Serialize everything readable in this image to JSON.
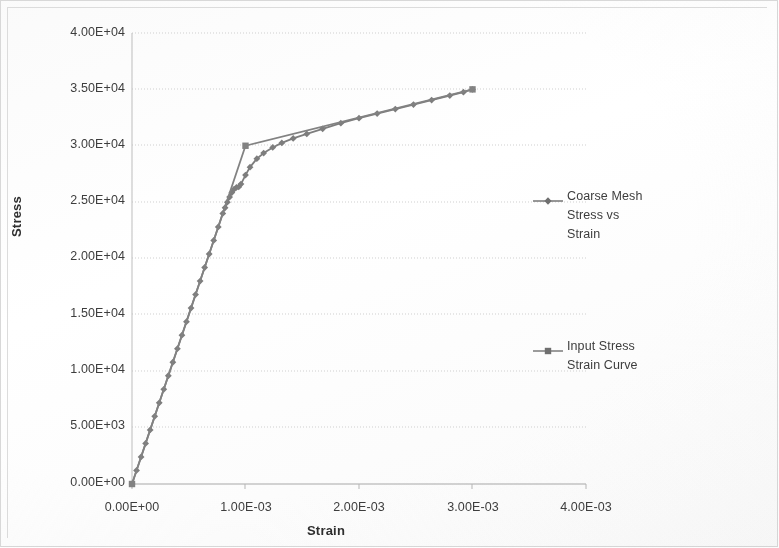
{
  "chart_data": {
    "type": "line",
    "title": "",
    "xlabel": "Strain",
    "ylabel": "Stress",
    "xlim": [
      0,
      0.004
    ],
    "ylim": [
      0,
      40000
    ],
    "grid": "horizontal",
    "legend_position": "right",
    "x_ticks": [
      "0.00E+00",
      "1.00E-03",
      "2.00E-03",
      "3.00E-03",
      "4.00E-03"
    ],
    "x_tick_values": [
      0,
      0.001,
      0.002,
      0.003,
      0.004
    ],
    "y_ticks": [
      "0.00E+00",
      "5.00E+03",
      "1.00E+04",
      "1.50E+04",
      "2.00E+04",
      "2.50E+04",
      "3.00E+04",
      "3.50E+04",
      "4.00E+04"
    ],
    "y_tick_values": [
      0,
      5000,
      10000,
      15000,
      20000,
      25000,
      30000,
      35000,
      40000
    ],
    "series": [
      {
        "name": "Coarse Mesh Stress vs Strain",
        "marker": "diamond",
        "color": "#7d7d7d",
        "x": [
          0.0,
          4e-05,
          8e-05,
          0.00012,
          0.00016,
          0.0002,
          0.00024,
          0.00028,
          0.00032,
          0.00036,
          0.0004,
          0.00044,
          0.00048,
          0.00052,
          0.00056,
          0.0006,
          0.00064,
          0.00068,
          0.00072,
          0.00076,
          0.0008,
          0.00082,
          0.00084,
          0.00086,
          0.00088,
          0.0009,
          0.00092,
          0.00094,
          0.00096,
          0.001,
          0.00104,
          0.0011,
          0.00116,
          0.00124,
          0.00132,
          0.00142,
          0.00154,
          0.00168,
          0.00184,
          0.002,
          0.00216,
          0.00232,
          0.00248,
          0.00264,
          0.0028,
          0.00292,
          0.003
        ],
        "y": [
          0,
          1200,
          2400,
          3600,
          4800,
          6000,
          7200,
          8400,
          9600,
          10800,
          12000,
          13200,
          14400,
          15600,
          16800,
          18000,
          19200,
          20400,
          21600,
          22800,
          24000,
          24500,
          25000,
          25450,
          25850,
          26150,
          26300,
          26350,
          26600,
          27400,
          28100,
          28850,
          29350,
          29850,
          30250,
          30650,
          31050,
          31500,
          32000,
          32450,
          32850,
          33250,
          33650,
          34050,
          34450,
          34750,
          35000
        ]
      },
      {
        "name": "Input Stress Strain Curve",
        "marker": "square",
        "color": "#828282",
        "x": [
          0.0,
          0.001,
          0.003
        ],
        "y": [
          0,
          30000,
          35000
        ]
      }
    ],
    "notes": {
      "yield_strain": 0.001,
      "yield_stress": 30000,
      "end_strain": 0.003,
      "end_stress": 35000,
      "elastic_modulus": 30000000
    }
  },
  "legend": {
    "items": [
      {
        "label_line1": "Coarse Mesh",
        "label_line2": "Stress  vs",
        "label_line3": "Strain",
        "marker": "diamond-marker-icon"
      },
      {
        "label_line1": "Input Stress",
        "label_line2": "Strain Curve",
        "label_line3": "",
        "marker": "square-marker-icon"
      }
    ]
  },
  "axes": {
    "x_title": "Strain",
    "y_title": "Stress"
  }
}
